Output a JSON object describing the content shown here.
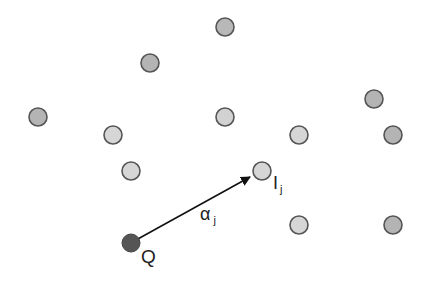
{
  "diagram": {
    "points": [
      {
        "id": "p1",
        "x": 225,
        "y": 27,
        "fill": "#b8b8b8"
      },
      {
        "id": "p2",
        "x": 150,
        "y": 63,
        "fill": "#b4b4b4"
      },
      {
        "id": "p3",
        "x": 38,
        "y": 117,
        "fill": "#b4b4b4"
      },
      {
        "id": "p4",
        "x": 225,
        "y": 117,
        "fill": "#d2d2d2"
      },
      {
        "id": "p5",
        "x": 113,
        "y": 135,
        "fill": "#d6d6d6"
      },
      {
        "id": "p6",
        "x": 374,
        "y": 99,
        "fill": "#b4b4b4"
      },
      {
        "id": "p7",
        "x": 299,
        "y": 135,
        "fill": "#d6d6d6"
      },
      {
        "id": "p8",
        "x": 393,
        "y": 135,
        "fill": "#b4b4b4"
      },
      {
        "id": "p9",
        "x": 131,
        "y": 171,
        "fill": "#d6d6d6"
      },
      {
        "id": "Ij",
        "x": 262,
        "y": 171,
        "fill": "#d6d6d6"
      },
      {
        "id": "p11",
        "x": 299,
        "y": 225,
        "fill": "#d6d6d6"
      },
      {
        "id": "p12",
        "x": 393,
        "y": 225,
        "fill": "#b4b4b4"
      }
    ],
    "query": {
      "x": 131,
      "y": 243,
      "fill": "#555555",
      "label": "Q"
    },
    "target_label": {
      "main": "I",
      "sub": "j"
    },
    "arrow_label": {
      "main": "α",
      "sub": "j"
    },
    "stroke": "#555555",
    "arrow_color": "#111111"
  }
}
